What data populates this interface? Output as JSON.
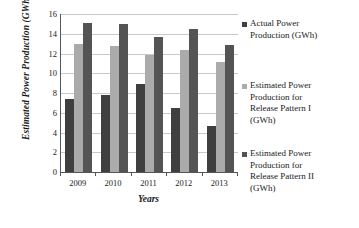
{
  "chart_data": {
    "type": "bar",
    "title": "",
    "xlabel": "Years",
    "ylabel": "Estimated Power Production (GWh)",
    "categories": [
      "2009",
      "2010",
      "2011",
      "2012",
      "2013"
    ],
    "ylim": [
      0,
      16
    ],
    "yticks": [
      0,
      2,
      4,
      6,
      8,
      10,
      12,
      14,
      16
    ],
    "ytick_labels": [
      "0",
      "2",
      "4",
      "6",
      "8",
      "10",
      "12",
      "14",
      "16"
    ],
    "grid": "horizontal",
    "legend_position": "right",
    "series": [
      {
        "name": "Actual Power Production (GWh)",
        "color": "#3f3f3f",
        "values": [
          7.4,
          7.8,
          8.9,
          6.5,
          4.7
        ]
      },
      {
        "name": "Estimated Power Production for Release Pattern I (GWh)",
        "color": "#ababab",
        "values": [
          13.0,
          12.8,
          11.8,
          12.4,
          11.1
        ]
      },
      {
        "name": "Estimated Power Production for Release Pattern II (GWh)",
        "color": "#545454",
        "values": [
          15.1,
          15.0,
          13.7,
          14.5,
          12.9
        ]
      }
    ]
  },
  "legend": {
    "entries": [
      "Actual Power\nProduction (GWh)",
      "Estimated Power\nProduction  for\nRelease Pattern I\n(GWh)",
      "Estimated Power\nProduction  for\nRelease Pattern II\n(GWh)"
    ]
  }
}
